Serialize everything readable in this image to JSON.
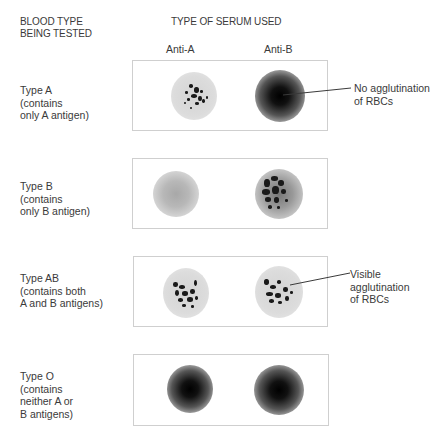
{
  "headers": {
    "blood_type": "BLOOD TYPE\nBEING TESTED",
    "blood_type_line1": "BLOOD TYPE",
    "blood_type_line2": "BEING TESTED",
    "serum": "TYPE OF SERUM USED"
  },
  "columns": [
    "Anti-A",
    "Anti-B"
  ],
  "rows": [
    {
      "label": "Type A\n(contains\nonly A antigen)",
      "anti_a": "agglutination",
      "anti_b": "no agglutination"
    },
    {
      "label": "Type B\n(contains\nonly B antigen)",
      "anti_a": "no agglutination (faint)",
      "anti_b": "agglutination"
    },
    {
      "label": "Type AB\n(contains both\nA and B antigens)",
      "anti_a": "agglutination",
      "anti_b": "agglutination"
    },
    {
      "label": "Type O\n(contains\nneither A or\nB antigens)",
      "anti_a": "no agglutination",
      "anti_b": "no agglutination"
    }
  ],
  "annotations": {
    "no_agglutination": "No agglutination\nof RBCs",
    "visible_agglutination": "Visible\nagglutination\nof RBCs"
  },
  "colors": {
    "text": "#3a3a3a",
    "box_border": "#cfcfcf",
    "clump": "#1a1a1a"
  }
}
